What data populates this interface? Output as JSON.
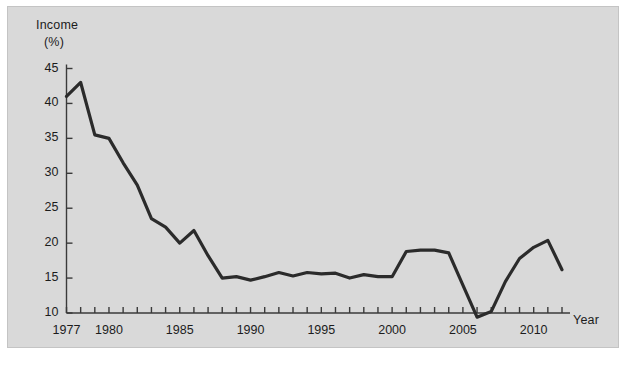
{
  "figure": {
    "background_color": "#d9d9d9",
    "page_color": "#ffffff",
    "border_color": "#c4c4c4",
    "line_color": "#2b2b2b",
    "axis_color": "#3a3a3a",
    "text_color": "#1c1c1c"
  },
  "labels": {
    "y_title_line1": "Income",
    "y_title_line2": "(%)",
    "x_title": "Year"
  },
  "chart_data": {
    "type": "line",
    "title": "",
    "xlabel": "Year",
    "ylabel": "Income (%)",
    "xlim": [
      1977,
      2012
    ],
    "ylim": [
      8.2,
      46.5
    ],
    "grid": false,
    "legend": null,
    "y_ticks": [
      10,
      15,
      20,
      25,
      30,
      35,
      40,
      45
    ],
    "y_tick_labels": [
      "10",
      "15",
      "20",
      "25",
      "30",
      "35",
      "40",
      "45"
    ],
    "x_ticks": [
      1977,
      1978,
      1979,
      1980,
      1981,
      1982,
      1983,
      1984,
      1985,
      1986,
      1987,
      1988,
      1989,
      1990,
      1991,
      1992,
      1993,
      1994,
      1995,
      1996,
      1997,
      1998,
      1999,
      2000,
      2001,
      2002,
      2003,
      2004,
      2005,
      2006,
      2007,
      2008,
      2009,
      2010,
      2011,
      2012
    ],
    "x_tick_labels": [
      {
        "value": 1977,
        "label": "1977"
      },
      {
        "value": 1980,
        "label": "1980"
      },
      {
        "value": 1985,
        "label": "1985"
      },
      {
        "value": 1990,
        "label": "1990"
      },
      {
        "value": 1995,
        "label": "1995"
      },
      {
        "value": 2000,
        "label": "2000"
      },
      {
        "value": 2005,
        "label": "2005"
      },
      {
        "value": 2010,
        "label": "2010"
      }
    ],
    "series": [
      {
        "name": "Income",
        "x": [
          1977,
          1978,
          1979,
          1980,
          1981,
          1982,
          1983,
          1984,
          1985,
          1986,
          1987,
          1988,
          1989,
          1990,
          1991,
          1992,
          1993,
          1994,
          1995,
          1996,
          1997,
          1998,
          1999,
          2000,
          2001,
          2002,
          2003,
          2004,
          2005,
          2006,
          2007,
          2008,
          2009,
          2010,
          2011,
          2012
        ],
        "values": [
          41.0,
          43.0,
          35.5,
          35.0,
          31.5,
          28.3,
          23.5,
          22.3,
          20.0,
          21.8,
          18.2,
          15.0,
          15.2,
          14.7,
          15.2,
          15.8,
          15.3,
          15.8,
          15.6,
          15.7,
          15.0,
          15.5,
          15.2,
          15.2,
          18.8,
          19.0,
          19.0,
          18.6,
          14.0,
          9.4,
          10.2,
          14.5,
          17.8,
          19.4,
          20.4,
          16.2
        ]
      }
    ]
  }
}
